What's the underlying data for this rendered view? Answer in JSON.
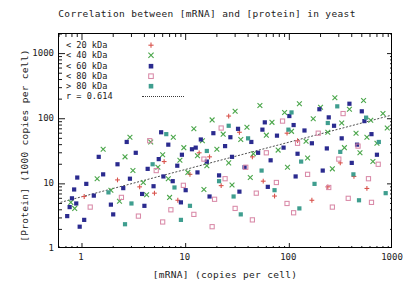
{
  "chart_data": {
    "type": "scatter",
    "title": "Correlation between [mRNA] and [protein] in yeast",
    "xlabel": "[mRNA] (copies per cell)",
    "ylabel": "[Protein] (1000 copies per cell)",
    "xscale": "log",
    "yscale": "log",
    "xlim": [
      0.6,
      1000
    ],
    "ylim": [
      1,
      2000
    ],
    "xticks": [
      "1",
      "10",
      "100",
      "1000"
    ],
    "xtick_values": [
      1,
      10,
      100,
      1000
    ],
    "yticks": [
      "1",
      "10",
      "100",
      "1000"
    ],
    "ytick_values": [
      1,
      10,
      100,
      1000
    ],
    "grid": false,
    "legend_position": "top-left-inside",
    "correlation_label": "r = 0.614",
    "correlation_value": 0.614,
    "trendline": {
      "style": "dotted",
      "color": "#3a3a3a",
      "x_start": 0.62,
      "y_start": 5.2,
      "x_end": 1000,
      "y_end": 115
    },
    "series": [
      {
        "name": "< 20  kDa",
        "marker": "plus",
        "color": "#d9544d",
        "points": [
          [
            1.05,
            6.4
          ],
          [
            2.2,
            11.5
          ],
          [
            3.6,
            9.0
          ],
          [
            5.0,
            7.2
          ],
          [
            6.2,
            22.0
          ],
          [
            8.4,
            5.6
          ],
          [
            11.0,
            14.0
          ],
          [
            13.5,
            30.0
          ],
          [
            17.0,
            26.0
          ],
          [
            22.0,
            9.4
          ],
          [
            26.0,
            110.0
          ],
          [
            33.0,
            62.0
          ],
          [
            44.0,
            26.0
          ],
          [
            56.0,
            11.0
          ],
          [
            72.0,
            6.5
          ],
          [
            95.0,
            60.0
          ],
          [
            120.0,
            46.0
          ],
          [
            165.0,
            5.6
          ],
          [
            235.0,
            9.0
          ],
          [
            310.0,
            21.0
          ],
          [
            420.0,
            13.0
          ],
          [
            560.0,
            8.5
          ]
        ]
      },
      {
        "name": "< 40  kDa",
        "marker": "cross",
        "color": "#4aa64a",
        "points": [
          [
            0.78,
            5.2
          ],
          [
            0.85,
            4.2
          ],
          [
            1.4,
            12.0
          ],
          [
            1.9,
            8.0
          ],
          [
            2.6,
            26.0
          ],
          [
            3.1,
            16.0
          ],
          [
            3.9,
            10.5
          ],
          [
            4.6,
            44.0
          ],
          [
            5.4,
            18.0
          ],
          [
            6.0,
            28.0
          ],
          [
            6.8,
            12.0
          ],
          [
            7.6,
            52.0
          ],
          [
            8.8,
            23.0
          ],
          [
            9.6,
            36.0
          ],
          [
            10.5,
            15.0
          ],
          [
            12.0,
            70.0
          ],
          [
            13.0,
            27.0
          ],
          [
            14.5,
            46.0
          ],
          [
            16.0,
            19.0
          ],
          [
            18.0,
            96.0
          ],
          [
            20.0,
            34.0
          ],
          [
            23.0,
            58.0
          ],
          [
            26.0,
            21.0
          ],
          [
            30.0,
            130.0
          ],
          [
            34.0,
            48.0
          ],
          [
            39.0,
            74.0
          ],
          [
            45.0,
            29.0
          ],
          [
            52.0,
            160.0
          ],
          [
            60.0,
            56.0
          ],
          [
            68.0,
            88.0
          ],
          [
            78.0,
            33.0
          ],
          [
            90.0,
            125.0
          ],
          [
            105.0,
            64.0
          ],
          [
            125.0,
            170.0
          ],
          [
            145.0,
            45.0
          ],
          [
            170.0,
            100.0
          ],
          [
            200.0,
            150.0
          ],
          [
            235.0,
            62.0
          ],
          [
            275.0,
            210.0
          ],
          [
            320.0,
            86.0
          ],
          [
            380.0,
            140.0
          ],
          [
            440.0,
            60.0
          ],
          [
            520.0,
            190.0
          ],
          [
            610.0,
            95.0
          ],
          [
            700.0,
            42.0
          ],
          [
            800.0,
            120.0
          ],
          [
            2.3,
            5.4
          ],
          [
            4.2,
            6.8
          ],
          [
            15.0,
            8.2
          ],
          [
            42.0,
            12.5
          ],
          [
            150.0,
            25.0
          ],
          [
            260.0,
            17.0
          ],
          [
            480.0,
            30.0
          ],
          [
            640.0,
            22.0
          ],
          [
            1.6,
            34.0
          ],
          [
            2.9,
            52.0
          ],
          [
            7.0,
            6.2
          ],
          [
            28.0,
            9.6
          ],
          [
            96.0,
            18.0
          ],
          [
            340.0,
            36.0
          ],
          [
            560.0,
            52.0
          ],
          [
            880.0,
            72.0
          ]
        ]
      },
      {
        "name": "< 60  kDa",
        "marker": "filled-square",
        "color": "#2b2b8f",
        "points": [
          [
            0.72,
            3.2
          ],
          [
            0.76,
            4.4
          ],
          [
            0.8,
            6.0
          ],
          [
            0.84,
            8.2
          ],
          [
            0.88,
            5.0
          ],
          [
            0.95,
            2.2
          ],
          [
            1.1,
            10.0
          ],
          [
            1.3,
            6.6
          ],
          [
            1.6,
            14.0
          ],
          [
            1.9,
            4.8
          ],
          [
            2.2,
            20.0
          ],
          [
            2.5,
            8.6
          ],
          [
            2.9,
            12.0
          ],
          [
            3.3,
            30.0
          ],
          [
            3.8,
            7.0
          ],
          [
            4.3,
            17.0
          ],
          [
            4.9,
            9.2
          ],
          [
            5.5,
            24.0
          ],
          [
            6.1,
            13.0
          ],
          [
            6.8,
            40.0
          ],
          [
            7.5,
            11.0
          ],
          [
            8.3,
            19.0
          ],
          [
            9.2,
            28.0
          ],
          [
            10.0,
            8.0
          ],
          [
            11.5,
            34.0
          ],
          [
            13.0,
            15.0
          ],
          [
            14.0,
            48.0
          ],
          [
            16.0,
            22.0
          ],
          [
            18.5,
            60.0
          ],
          [
            21.0,
            13.5
          ],
          [
            24.0,
            38.0
          ],
          [
            28.0,
            26.0
          ],
          [
            32.0,
            70.0
          ],
          [
            37.0,
            18.0
          ],
          [
            43.0,
            44.0
          ],
          [
            50.0,
            30.0
          ],
          [
            58.0,
            88.0
          ],
          [
            66.0,
            23.0
          ],
          [
            76.0,
            55.0
          ],
          [
            88.0,
            36.0
          ],
          [
            100.0,
            110.0
          ],
          [
            120.0,
            29.0
          ],
          [
            140.0,
            66.0
          ],
          [
            165.0,
            42.0
          ],
          [
            195.0,
            140.0
          ],
          [
            230.0,
            35.0
          ],
          [
            270.0,
            78.0
          ],
          [
            320.0,
            50.0
          ],
          [
            380.0,
            170.0
          ],
          [
            450.0,
            40.0
          ],
          [
            530.0,
            92.0
          ],
          [
            620.0,
            58.0
          ],
          [
            1.05,
            2.8
          ],
          [
            2.0,
            3.4
          ],
          [
            4.0,
            4.6
          ],
          [
            9.0,
            5.2
          ],
          [
            17.0,
            6.4
          ],
          [
            33.0,
            7.6
          ],
          [
            62.0,
            9.0
          ],
          [
            115.0,
            13.0
          ],
          [
            210.0,
            16.0
          ],
          [
            400.0,
            21.0
          ],
          [
            700.0,
            28.0
          ],
          [
            0.9,
            12.5
          ],
          [
            1.45,
            26.0
          ],
          [
            2.7,
            44.0
          ],
          [
            5.8,
            62.0
          ],
          [
            12.5,
            36.0
          ],
          [
            27.0,
            52.0
          ],
          [
            55.0,
            68.0
          ],
          [
            110.0,
            80.0
          ],
          [
            240.0,
            105.0
          ],
          [
            500.0,
            130.0
          ]
        ]
      },
      {
        "name": "< 80  kDa",
        "marker": "open-square",
        "color": "#d98aa8",
        "points": [
          [
            1.2,
            4.4
          ],
          [
            2.4,
            6.2
          ],
          [
            3.5,
            3.2
          ],
          [
            5.2,
            16.0
          ],
          [
            7.2,
            4.0
          ],
          [
            9.5,
            9.5
          ],
          [
            12.0,
            3.4
          ],
          [
            15.0,
            24.0
          ],
          [
            19.0,
            5.8
          ],
          [
            24.0,
            12.0
          ],
          [
            30.0,
            4.2
          ],
          [
            38.0,
            18.0
          ],
          [
            48.0,
            7.2
          ],
          [
            60.0,
            30.0
          ],
          [
            75.0,
            10.5
          ],
          [
            95.0,
            5.0
          ],
          [
            120.0,
            42.0
          ],
          [
            150.0,
            14.0
          ],
          [
            190.0,
            60.0
          ],
          [
            240.0,
            8.8
          ],
          [
            300.0,
            24.0
          ],
          [
            370.0,
            6.0
          ],
          [
            460.0,
            38.0
          ],
          [
            580.0,
            12.0
          ],
          [
            720.0,
            20.0
          ],
          [
            6.0,
            2.6
          ],
          [
            18.0,
            2.2
          ],
          [
            44.0,
            2.8
          ],
          [
            110.0,
            3.6
          ],
          [
            260.0,
            4.4
          ],
          [
            620.0,
            5.2
          ],
          [
            4.5,
            46.0
          ],
          [
            22.0,
            72.0
          ],
          [
            86.0,
            92.0
          ],
          [
            330.0,
            120.0
          ]
        ]
      },
      {
        "name": "> 80  kDa",
        "marker": "filled-square",
        "color": "#3f9e8f",
        "points": [
          [
            1.8,
            7.4
          ],
          [
            3.0,
            5.0
          ],
          [
            4.8,
            20.0
          ],
          [
            7.8,
            8.8
          ],
          [
            11.0,
            4.6
          ],
          [
            16.0,
            32.0
          ],
          [
            21.0,
            11.0
          ],
          [
            29.0,
            6.4
          ],
          [
            40.0,
            50.0
          ],
          [
            54.0,
            16.0
          ],
          [
            72.0,
            8.0
          ],
          [
            98.0,
            68.0
          ],
          [
            130.0,
            22.0
          ],
          [
            175.0,
            10.0
          ],
          [
            235.0,
            86.0
          ],
          [
            310.0,
            31.0
          ],
          [
            415.0,
            14.0
          ],
          [
            550.0,
            104.0
          ],
          [
            730.0,
            44.0
          ],
          [
            2.6,
            2.4
          ],
          [
            9.0,
            2.8
          ],
          [
            34.0,
            3.4
          ],
          [
            125.0,
            4.2
          ],
          [
            470.0,
            5.6
          ],
          [
            850.0,
            7.2
          ],
          [
            6.5,
            58.0
          ],
          [
            26.0,
            78.0
          ],
          [
            105.0,
            125.0
          ],
          [
            290.0,
            155.0
          ]
        ]
      }
    ]
  },
  "axes": {
    "x_tick_labels": [
      "1",
      "10",
      "100",
      "1000"
    ],
    "y_tick_labels": [
      "1",
      "10",
      "100",
      "1000"
    ]
  },
  "legend": {
    "items": [
      {
        "label": "< 20  kDa",
        "marker": "plus",
        "color": "#d9544d"
      },
      {
        "label": "< 40  kDa",
        "marker": "cross",
        "color": "#4aa64a"
      },
      {
        "label": "< 60  kDa",
        "marker": "filled-square",
        "color": "#2b2b8f"
      },
      {
        "label": "< 80  kDa",
        "marker": "open-square",
        "color": "#d98aa8"
      },
      {
        "label": "> 80  kDa",
        "marker": "filled-square",
        "color": "#3f9e8f"
      }
    ],
    "correlation": "r = 0.614"
  }
}
